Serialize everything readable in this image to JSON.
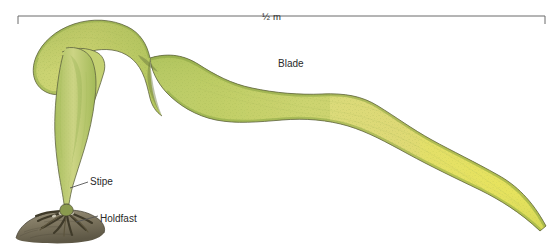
{
  "figure": {
    "background_color": "#ffffff"
  },
  "scale_bar": {
    "label": "½ m",
    "color": "#555555",
    "x_start": 18,
    "x_end": 545,
    "y": 16
  },
  "labels": {
    "blade": "Blade",
    "stipe": "Stipe",
    "holdfast": "Holdfast"
  },
  "colors": {
    "blade_light": "#e3e38a",
    "blade_yellow": "#e0de6d",
    "blade_green": "#b9cc63",
    "blade_edge_green": "#8aa846",
    "blade_tip_yellow": "#e8e45c",
    "outline": "#5e6340",
    "stipe_green": "#b6c86a",
    "holdfast_dark": "#4a4431",
    "rock_gray": "#8d8673",
    "text": "#2a2a2a"
  }
}
